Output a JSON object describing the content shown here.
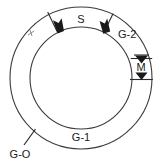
{
  "diagram": {
    "background_color": "#ffffff",
    "line_color": "#3b3b3b",
    "label_color": "#1a1a1a",
    "geometry": {
      "center_x": 81,
      "center_y": 78,
      "outer_radius": 71,
      "inner_radius": 51
    },
    "labels": {
      "sector_s": "S",
      "sector_g2": "G-2",
      "sector_m": "M",
      "ring_g1": "G-1",
      "leader_go": "G-O"
    },
    "markers": [
      {
        "name": "s-sector-left-arrow",
        "label": "S",
        "kind": "radial-boundary-arrow"
      },
      {
        "name": "s-sector-right-arrow",
        "label": "G-2",
        "kind": "radial-boundary-arrow"
      },
      {
        "name": "m-sector-top-arrow",
        "label": "M",
        "kind": "dimension-arrow"
      },
      {
        "name": "m-sector-bottom-arrow",
        "label": "M",
        "kind": "dimension-arrow"
      }
    ]
  }
}
